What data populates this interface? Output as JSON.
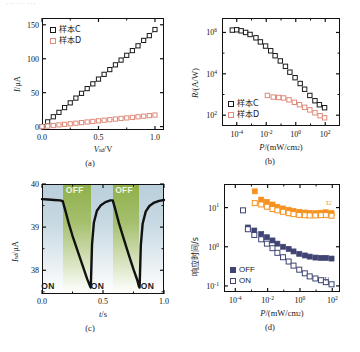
{
  "figure": {
    "top_cut_text": "··· ··· ···",
    "panels": [
      "(a)",
      "(b)",
      "(c)",
      "(d)"
    ]
  },
  "colors": {
    "sample_c": "#1a1a1a",
    "sample_d": "#e08a7a",
    "tau1_off": "#3f4473",
    "tau2": "#f6911e",
    "on_band": "#b9cfdb",
    "off_band": "#8fb04a"
  },
  "panel_a": {
    "caption": "(a)",
    "xlabel_main": "V",
    "xlabel_sub": "sd",
    "xlabel_unit": "/V",
    "ylabel_main": "I",
    "ylabel_unit": "/μA",
    "xticks": [
      "0.0",
      "0.5",
      "1.0"
    ],
    "yticks": [
      "0",
      "50",
      "100",
      "150"
    ],
    "legend": [
      {
        "label": "样本C",
        "marker": "open-square-black"
      },
      {
        "label": "样本D",
        "marker": "open-square-red"
      }
    ]
  },
  "panel_b": {
    "caption": "(b)",
    "xlabel_main": "P",
    "xlabel_unit": "/(mW/cm",
    "xlabel_sup": "2",
    "xlabel_close": ")",
    "ylabel_main": "R",
    "ylabel_unit": "/(A/W)",
    "xticks": [
      "10",
      "10",
      "10",
      "10"
    ],
    "xtick_exps": [
      "-4",
      "-2",
      "0",
      "2"
    ],
    "yticks": [
      "10",
      "10",
      "10"
    ],
    "ytick_exps": [
      "6",
      "4",
      "2"
    ],
    "legend": [
      {
        "label": "样本C",
        "marker": "open-square-black"
      },
      {
        "label": "样本D",
        "marker": "open-square-red"
      }
    ]
  },
  "panel_c": {
    "caption": "(c)",
    "xlabel_main": "t",
    "xlabel_unit": "/s",
    "ylabel_main": "I",
    "ylabel_sub": "sd",
    "ylabel_unit": "/μA",
    "xticks": [
      "0.0",
      "0.5",
      "1.0"
    ],
    "yticks": [
      "38",
      "39",
      "40"
    ],
    "band_labels": [
      "ON",
      "OFF",
      "ON",
      "OFF",
      "ON"
    ]
  },
  "panel_d": {
    "caption": "(d)",
    "xlabel_main": "P",
    "xlabel_unit": "/(mW/cm",
    "xlabel_sup": "2",
    "xlabel_close": ")",
    "ylabel": "响应时间/s",
    "xticks": [
      "10",
      "10",
      "10",
      "10"
    ],
    "xtick_exps": [
      "-4",
      "-2",
      "0",
      "2"
    ],
    "yticks": [
      "10",
      "10",
      "10"
    ],
    "ytick_exps": [
      "1",
      "0",
      "-1"
    ],
    "legend": [
      {
        "label": "OFF",
        "marker": "filled-square-navy"
      },
      {
        "label": "ON",
        "marker": "open-square-navy"
      }
    ],
    "annotations": [
      {
        "label": "τ",
        "sub": "2"
      },
      {
        "label": "τ",
        "sub": "1"
      }
    ]
  },
  "chart_data": [
    {
      "type": "scatter",
      "panel": "(a)",
      "title": "",
      "xlabel": "Vsd / V",
      "ylabel": "I / μA",
      "xlim": [
        0,
        1.08
      ],
      "ylim": [
        -5,
        160
      ],
      "xticks": [
        0.0,
        0.5,
        1.0
      ],
      "yticks": [
        0,
        50,
        100,
        150
      ],
      "grid": false,
      "legend_position": "upper-left",
      "series": [
        {
          "name": "样本C",
          "color": "#1a1a1a",
          "marker": "open-square",
          "x": [
            0.0,
            0.05,
            0.1,
            0.15,
            0.2,
            0.25,
            0.3,
            0.35,
            0.4,
            0.45,
            0.5,
            0.55,
            0.6,
            0.65,
            0.7,
            0.75,
            0.8,
            0.85,
            0.9,
            0.95,
            1.0
          ],
          "y": [
            0,
            7,
            14.5,
            21,
            28,
            35,
            42,
            49,
            56,
            63,
            70,
            77,
            84,
            91,
            98,
            105,
            112,
            119,
            127,
            134,
            143
          ]
        },
        {
          "name": "样本D",
          "color": "#e08a7a",
          "marker": "open-square",
          "x": [
            0.0,
            0.05,
            0.1,
            0.15,
            0.2,
            0.25,
            0.3,
            0.35,
            0.4,
            0.45,
            0.5,
            0.55,
            0.6,
            0.65,
            0.7,
            0.75,
            0.8,
            0.85,
            0.9,
            0.95,
            1.0
          ],
          "y": [
            0,
            0.8,
            1.6,
            2.5,
            3.3,
            4.2,
            5.0,
            5.9,
            6.8,
            7.6,
            8.5,
            9.4,
            10.2,
            11.1,
            12.0,
            12.8,
            13.6,
            14.5,
            15.3,
            16.2,
            17.0
          ]
        }
      ]
    },
    {
      "type": "scatter",
      "panel": "(b)",
      "xlabel": "P / (mW/cm2)",
      "ylabel": "R / (A/W)",
      "xscale": "log",
      "yscale": "log",
      "xlim": [
        1e-05,
        1000.0
      ],
      "ylim": [
        30,
        5000000.0
      ],
      "xticks": [
        0.0001,
        0.01,
        1.0,
        100.0
      ],
      "yticks": [
        1000000.0,
        10000.0,
        100.0
      ],
      "grid": false,
      "legend_position": "lower-left",
      "series": [
        {
          "name": "样本C",
          "color": "#1a1a1a",
          "marker": "open-square",
          "x": [
            5e-05,
            0.0001,
            0.0002,
            0.0004,
            0.0008,
            0.002,
            0.004,
            0.009,
            0.02,
            0.04,
            0.09,
            0.2,
            0.4,
            0.9,
            2,
            4,
            9,
            20,
            40,
            90
          ],
          "y": [
            1300000.0,
            1350000.0,
            1200000.0,
            1000000.0,
            800000.0,
            550000.0,
            350000.0,
            220000.0,
            130000.0,
            75000.0,
            42000.0,
            23000.0,
            12000.0,
            6500.0,
            3400.0,
            1800.0,
            900.0,
            500.0,
            320.0,
            230.0
          ]
        },
        {
          "name": "样本D",
          "color": "#e08a7a",
          "marker": "open-square",
          "x": [
            0.012,
            0.03,
            0.07,
            0.15,
            0.35,
            0.8,
            1.8,
            4,
            9,
            20,
            45,
            90
          ],
          "y": [
            900.0,
            750.0,
            720.0,
            680.0,
            550.0,
            420.0,
            320.0,
            240.0,
            180.0,
            130.0,
            95.0,
            75.0
          ]
        }
      ]
    },
    {
      "type": "line",
      "panel": "(c)",
      "xlabel": "t / s",
      "ylabel": "Isd / μA",
      "xlim": [
        0,
        1.0
      ],
      "ylim": [
        37.45,
        40.0
      ],
      "xticks": [
        0.0,
        0.5,
        1.0
      ],
      "yticks": [
        38,
        39,
        40
      ],
      "grid": false,
      "bands": [
        {
          "label": "ON",
          "x0": 0.0,
          "x1": 0.17,
          "color": "#b9cfdb"
        },
        {
          "label": "OFF",
          "x0": 0.17,
          "x1": 0.4,
          "color": "#8fb04a"
        },
        {
          "label": "ON",
          "x0": 0.4,
          "x1": 0.58,
          "color": "#b9cfdb"
        },
        {
          "label": "OFF",
          "x0": 0.58,
          "x1": 0.8,
          "color": "#8fb04a"
        },
        {
          "label": "ON",
          "x0": 0.8,
          "x1": 1.0,
          "color": "#b9cfdb"
        }
      ],
      "series": [
        {
          "name": "Isd",
          "color": "#111111",
          "x": [
            0.0,
            0.05,
            0.1,
            0.15,
            0.17,
            0.19,
            0.22,
            0.25,
            0.28,
            0.31,
            0.34,
            0.37,
            0.395,
            0.4,
            0.41,
            0.425,
            0.45,
            0.48,
            0.52,
            0.56,
            0.58,
            0.6,
            0.63,
            0.66,
            0.69,
            0.72,
            0.75,
            0.78,
            0.795,
            0.8,
            0.81,
            0.825,
            0.85,
            0.88,
            0.92,
            0.96,
            1.0
          ],
          "y": [
            39.65,
            39.64,
            39.63,
            39.62,
            39.6,
            39.4,
            39.08,
            38.8,
            38.55,
            38.3,
            38.05,
            37.8,
            37.62,
            37.6,
            38.6,
            39.1,
            39.38,
            39.5,
            39.58,
            39.62,
            39.62,
            39.42,
            39.1,
            38.82,
            38.55,
            38.28,
            38.02,
            37.78,
            37.62,
            37.6,
            38.58,
            39.08,
            39.36,
            39.49,
            39.57,
            39.61,
            39.63
          ]
        }
      ]
    },
    {
      "type": "scatter",
      "panel": "(d)",
      "xlabel": "P / (mW/cm2)",
      "ylabel": "响应时间 / s",
      "xscale": "log",
      "yscale": "log",
      "xlim": [
        2e-05,
        300.0
      ],
      "ylim": [
        0.07,
        40
      ],
      "xticks": [
        0.0001,
        0.01,
        1.0,
        100.0
      ],
      "yticks": [
        10.0,
        1.0,
        0.1
      ],
      "grid": false,
      "legend_position": "lower-left",
      "series": [
        {
          "name": "τ2 OFF",
          "color": "#f6911e",
          "marker": "filled-square",
          "x": [
            0.0016,
            0.004,
            0.009,
            0.02,
            0.04,
            0.09,
            0.2,
            0.4,
            0.9,
            2,
            4,
            9,
            20,
            40,
            90
          ],
          "y": [
            26,
            16,
            14,
            12,
            10.5,
            9.5,
            8.8,
            8.2,
            7.8,
            7.5,
            7.3,
            7.2,
            7.4,
            7.6,
            7.2
          ]
        },
        {
          "name": "τ2 ON",
          "color": "#f6911e",
          "marker": "open-square",
          "x": [
            0.0016,
            0.004,
            0.009,
            0.02,
            0.04,
            0.09,
            0.2,
            0.4,
            0.9,
            2,
            4,
            9,
            20,
            40,
            90
          ],
          "y": [
            13,
            12,
            10.5,
            9.2,
            8.5,
            7.8,
            7.2,
            6.8,
            6.5,
            6.4,
            6.3,
            6.3,
            6.4,
            6.5,
            6.2
          ]
        },
        {
          "name": "τ1 OFF",
          "color": "#3f4473",
          "marker": "filled-square",
          "x": [
            0.0006,
            0.0015,
            0.004,
            0.009,
            0.02,
            0.04,
            0.09,
            0.2,
            0.4,
            0.9,
            2,
            4,
            9,
            20,
            40,
            90
          ],
          "y": [
            3.1,
            2.6,
            2.1,
            1.75,
            1.45,
            1.2,
            1.0,
            0.88,
            0.76,
            0.66,
            0.6,
            0.56,
            0.53,
            0.52,
            0.52,
            0.5
          ]
        },
        {
          "name": "τ1 ON",
          "color": "#3f4473",
          "marker": "open-square",
          "x": [
            0.0003,
            0.0006,
            0.0015,
            0.004,
            0.009,
            0.02,
            0.04,
            0.09,
            0.2,
            0.4,
            0.9,
            2,
            4,
            9,
            20,
            40,
            90
          ],
          "y": [
            8.5,
            2.8,
            2.0,
            1.55,
            1.2,
            0.92,
            0.7,
            0.54,
            0.42,
            0.33,
            0.26,
            0.21,
            0.175,
            0.155,
            0.14,
            0.125,
            0.11
          ]
        }
      ]
    }
  ]
}
